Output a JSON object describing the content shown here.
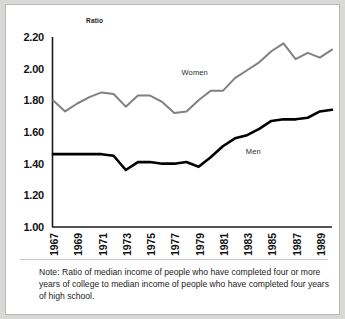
{
  "chart_data": {
    "type": "line",
    "title": "",
    "subtitle": "",
    "ylabel": "Ratio",
    "xlabel": "",
    "ylim": [
      1.0,
      2.2
    ],
    "yticks": [
      "1.00",
      "1.20",
      "1.40",
      "1.60",
      "1.80",
      "2.00",
      "2.20"
    ],
    "ytick_values": [
      1.0,
      1.2,
      1.4,
      1.6,
      1.8,
      2.0,
      2.2
    ],
    "xlim": [
      1967,
      1990
    ],
    "xticks": [
      "1967",
      "1969",
      "1971",
      "1973",
      "1975",
      "1977",
      "1979",
      "1981",
      "1983",
      "1985",
      "1987",
      "1989"
    ],
    "xtick_values": [
      1967,
      1969,
      1971,
      1973,
      1975,
      1977,
      1979,
      1981,
      1983,
      1985,
      1987,
      1989
    ],
    "x": [
      1967,
      1968,
      1969,
      1970,
      1971,
      1972,
      1973,
      1974,
      1975,
      1976,
      1977,
      1978,
      1979,
      1980,
      1981,
      1982,
      1983,
      1984,
      1985,
      1986,
      1987,
      1988,
      1989,
      1990
    ],
    "grid": false,
    "legend_position": "inline-annotation",
    "series": [
      {
        "name": "Women",
        "color": "#808080",
        "values": [
          1.8,
          1.73,
          1.78,
          1.82,
          1.85,
          1.84,
          1.76,
          1.83,
          1.83,
          1.79,
          1.72,
          1.73,
          1.8,
          1.86,
          1.86,
          1.94,
          1.99,
          2.04,
          2.11,
          2.16,
          2.06,
          2.1,
          2.07,
          2.12
        ],
        "label_text": "Women"
      },
      {
        "name": "Men",
        "color": "#000000",
        "values": [
          1.46,
          1.46,
          1.46,
          1.46,
          1.46,
          1.45,
          1.36,
          1.41,
          1.41,
          1.4,
          1.4,
          1.41,
          1.38,
          1.44,
          1.51,
          1.56,
          1.58,
          1.62,
          1.67,
          1.68,
          1.68,
          1.69,
          1.73,
          1.74
        ],
        "label_text": "Men"
      }
    ],
    "annotations": [
      {
        "text": "Women",
        "x": 1977.6,
        "y": 1.97
      },
      {
        "text": "Men",
        "x": 1982.9,
        "y": 1.475
      }
    ],
    "note": "Note: Ratio of median income of people who have completed four or more years of college to median income of people who have completed four years of high school."
  }
}
